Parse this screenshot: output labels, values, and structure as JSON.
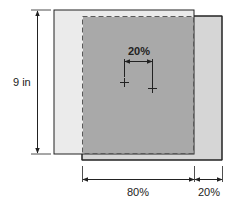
{
  "labels": {
    "height": "9 in",
    "shift": "20%",
    "width_main": "80%",
    "width_offset": "20%"
  },
  "colors": {
    "outer_left_fill": "#ebebeb",
    "outer_right_fill": "#d6d6d6",
    "overlap_fill": "#a9a9a9",
    "stroke": "#222222",
    "dashed_stroke": "#5a5a5a"
  }
}
